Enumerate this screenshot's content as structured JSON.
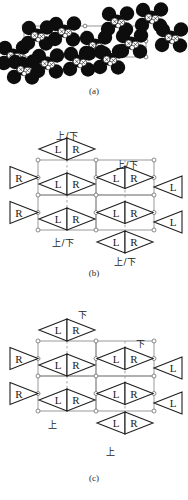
{
  "figure": {
    "panels": [
      {
        "id": "a",
        "caption": "(a)",
        "type": "molecular-packing-diagram",
        "description": "space-filling molecular packing of a crystal viewed along an axis, with unit-cell outline"
      },
      {
        "id": "b",
        "caption": "(b)",
        "type": "schematic-lattice",
        "cell_labels": [
          "L",
          "R"
        ],
        "edge_labels": [
          "R",
          "L"
        ],
        "orientation_labels": [
          "上/下",
          "上/下",
          "上/下",
          "上/下"
        ]
      },
      {
        "id": "c",
        "caption": "(c)",
        "type": "schematic-lattice",
        "cell_labels": [
          "L",
          "R"
        ],
        "edge_labels": [
          "R",
          "L"
        ],
        "orientation_labels": [
          "下",
          "下",
          "上",
          "上"
        ]
      }
    ],
    "glyphs": {
      "left_handed": "L",
      "right_handed": "R",
      "up": "上",
      "down": "下",
      "up_down": "上/下"
    },
    "colors": {
      "ink": "#1a1a1a",
      "lattice_line": "#8f8f8f",
      "dashed_line": "#9a9a9a",
      "node_fill": "#ffffff",
      "atom_dark": "#0d0d0d",
      "atom_light": "#ffffff",
      "background": "#ffffff"
    }
  },
  "panel_a": {
    "caption": "(a)"
  },
  "panel_b": {
    "caption": "(b)",
    "label_top_left": "上/下",
    "label_top_right": "上/下",
    "label_bottom_left": "上/下",
    "label_bottom_right": "上/下",
    "triangles": {
      "outer_left_top": "R",
      "outer_left_bottom": "R",
      "outer_right_top": "L",
      "outer_right_bottom": "L",
      "top_pair_left": "L",
      "top_pair_right": "R",
      "bottom_pair_left": "L",
      "bottom_pair_right": "R",
      "inner_left": "L",
      "inner_right": "R"
    }
  },
  "panel_c": {
    "caption": "(c)",
    "label_top_left": "下",
    "label_top_right": "下",
    "label_bottom_left": "上",
    "label_bottom_right": "上",
    "triangles": {
      "outer_left_top": "R",
      "outer_left_bottom": "R",
      "outer_right_top": "L",
      "outer_right_bottom": "L",
      "top_pair_left": "L",
      "top_pair_right": "R",
      "bottom_pair_left": "L",
      "bottom_pair_right": "R",
      "inner_left": "L",
      "inner_right": "R"
    }
  }
}
